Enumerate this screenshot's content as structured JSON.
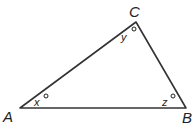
{
  "diagram": {
    "type": "triangle",
    "vertices": [
      {
        "label": "A",
        "x": 20,
        "y": 108
      },
      {
        "label": "B",
        "x": 186,
        "y": 108
      },
      {
        "label": "C",
        "x": 136,
        "y": 22
      }
    ],
    "vertex_labels": {
      "A": "A",
      "B": "B",
      "C": "C"
    },
    "angles": [
      {
        "vertex": "A",
        "variable": "x",
        "unit": "°"
      },
      {
        "vertex": "C",
        "variable": "y",
        "unit": "°"
      },
      {
        "vertex": "B",
        "variable": "z",
        "unit": "°"
      }
    ],
    "angle_labels": {
      "x": "x",
      "y": "y",
      "z": "z"
    },
    "stroke_color": "#333333"
  }
}
